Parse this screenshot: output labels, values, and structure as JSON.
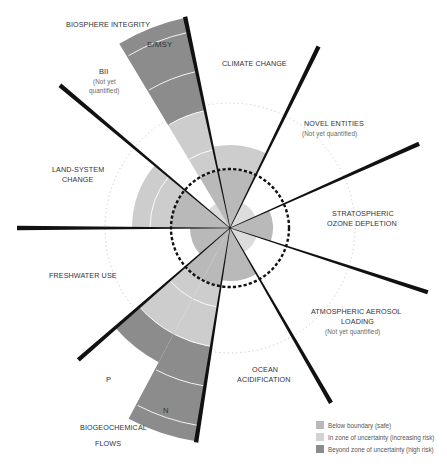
{
  "chart_data": {
    "type": "radial-sector",
    "center": [
      230,
      228
    ],
    "safe_boundary_radius": 59,
    "outer_dotted_radius": 125,
    "colors": {
      "safe": "#b9b9b9",
      "uncertainty": "#cdcdcd",
      "high_risk": "#8c8c8c",
      "center_light": "#dcdcdc",
      "divider": "#ffffff",
      "line": "#111111"
    },
    "boundary_lines": [
      {
        "angle": 348,
        "length": 216
      },
      {
        "angle": 26,
        "length": 202
      },
      {
        "angle": 66,
        "length": 207
      },
      {
        "angle": 108,
        "length": 208
      },
      {
        "angle": 150,
        "length": 202
      },
      {
        "angle": 189,
        "length": 217
      },
      {
        "angle": 229,
        "length": 201
      },
      {
        "angle": 270,
        "length": 213
      },
      {
        "angle": 310,
        "length": 222
      }
    ],
    "sectors": [
      {
        "name": "Climate change",
        "start": 348,
        "end": 26,
        "value": 83,
        "status": "uncertainty"
      },
      {
        "name": "Novel entities",
        "start": 26,
        "end": 66,
        "value": null,
        "status": "not quantified"
      },
      {
        "name": "Stratospheric ozone depletion",
        "start": 66,
        "end": 108,
        "value": 43,
        "status": "safe"
      },
      {
        "name": "Atmospheric aerosol loading",
        "start": 108,
        "end": 150,
        "value": null,
        "status": "not quantified"
      },
      {
        "name": "Ocean acidification",
        "start": 150,
        "end": 189,
        "value": 53,
        "status": "safe"
      },
      {
        "name": "Biogeochemical flows: N",
        "start": 189,
        "end": 208,
        "value": 216,
        "status": "high risk"
      },
      {
        "name": "Biogeochemical flows: P",
        "start": 208,
        "end": 229,
        "value": 152,
        "status": "high risk"
      },
      {
        "name": "Freshwater use",
        "start": 229,
        "end": 270,
        "value": 40,
        "status": "safe"
      },
      {
        "name": "Land-system change",
        "start": 270,
        "end": 310,
        "value": 98,
        "status": "uncertainty"
      },
      {
        "name": "Biosphere integrity: BII",
        "start": 310,
        "end": 329,
        "value": null,
        "status": "not quantified"
      },
      {
        "name": "Biosphere integrity: E/MSY",
        "start": 329,
        "end": 348,
        "value": 215,
        "status": "high risk"
      }
    ],
    "legend": [
      {
        "label": "Below boundary (safe)",
        "color": "#b9b9b9"
      },
      {
        "label": "In zone of uncertainty (increasing risk)",
        "color": "#cdcdcd"
      },
      {
        "label": "Beyond zone of uncertainty (high risk)",
        "color": "#8c8c8c"
      }
    ]
  },
  "labels": {
    "biosphere": "BIOSPHERE INTEGRITY",
    "emsy": "E/MSY",
    "bii": "BII",
    "bii_sub1": "(Not yet",
    "bii_sub2": "quantified)",
    "climate": "CLIMATE CHANGE",
    "novel": "NOVEL ENTITIES",
    "novel_sub": "(Not yet quantified)",
    "land1": "LAND-SYSTEM",
    "land2": "CHANGE",
    "ozone1": "STRATOSPHERIC",
    "ozone2": "OZONE DEPLETION",
    "fresh": "FRESHWATER USE",
    "aerosol1": "ATMOSPHERIC AEROSOL",
    "aerosol2": "LOADING",
    "aerosol_sub": "(Not yet quantified)",
    "ocean1": "OCEAN",
    "ocean2": "ACIDIFICATION",
    "p": "P",
    "n": "N",
    "bio1": "BIOGEOCHEMICAL",
    "bio2": "FLOWS"
  },
  "legend": {
    "safe": "Below boundary (safe)",
    "uncertainty": "In zone of uncertainty (increasing risk)",
    "high": "Beyond zone of uncertainty (high risk)"
  }
}
